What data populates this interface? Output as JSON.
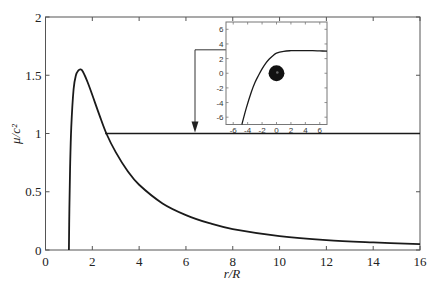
{
  "chart_data": [
    {
      "type": "line",
      "title": "",
      "xlabel": "r/R",
      "ylabel": "μ/c²",
      "xlim": [
        0,
        16
      ],
      "ylim": [
        0,
        2
      ],
      "xticks": [
        0,
        2,
        4,
        6,
        8,
        10,
        12,
        14,
        16
      ],
      "yticks": [
        0,
        0.5,
        1,
        1.5,
        2
      ],
      "ytick_labels": [
        "0",
        "0.5",
        "1",
        "1.5",
        "2"
      ],
      "grid": false,
      "series": [
        {
          "name": "mu/c^2 curve",
          "x": [
            1.0,
            1.02,
            1.05,
            1.1,
            1.2,
            1.3,
            1.4,
            1.5,
            1.6,
            1.8,
            2.0,
            2.3,
            2.6,
            3.0,
            3.5,
            4.0,
            5.0,
            6.0,
            7.0,
            8.0,
            10.0,
            12.0,
            14.0,
            16.0
          ],
          "y": [
            0.0,
            0.35,
            0.7,
            1.05,
            1.38,
            1.5,
            1.54,
            1.55,
            1.53,
            1.44,
            1.33,
            1.16,
            1.0,
            0.84,
            0.68,
            0.56,
            0.4,
            0.3,
            0.23,
            0.18,
            0.12,
            0.085,
            0.065,
            0.05
          ]
        },
        {
          "name": "horizontal reference line",
          "x": [
            2.55,
            16
          ],
          "y": [
            1,
            1
          ]
        }
      ],
      "annotations": [
        {
          "type": "arrow",
          "description": "arrow from inset left edge at inset y≈3, down to the y=1 line",
          "x_data": 6.4,
          "y_from_px": 46,
          "y_to": 1.0
        }
      ]
    },
    {
      "type": "line",
      "title": "inset",
      "xlabel": "",
      "ylabel": "",
      "xlim": [
        -7,
        7
      ],
      "ylim": [
        -7,
        7
      ],
      "xticks": [
        -6,
        -4,
        -2,
        0,
        2,
        4,
        6
      ],
      "yticks": [
        6,
        4,
        2,
        0,
        -2,
        -4,
        -6
      ],
      "grid": false,
      "series": [
        {
          "name": "inset curve",
          "x": [
            -4.8,
            -4.2,
            -3.5,
            -3.0,
            -2.5,
            -2.0,
            -1.5,
            -1.0,
            -0.5,
            0.0,
            1.0,
            2.0,
            3.0,
            4.0,
            5.0,
            6.0,
            7.0
          ],
          "y": [
            -7.0,
            -4.8,
            -2.6,
            -1.3,
            -0.3,
            0.6,
            1.35,
            1.95,
            2.4,
            2.75,
            3.0,
            3.08,
            3.1,
            3.1,
            3.08,
            3.05,
            3.02
          ]
        }
      ],
      "markers": [
        {
          "type": "filled-circle",
          "x": 0,
          "y": 0,
          "radius": 1.1,
          "color": "#111111"
        }
      ]
    }
  ],
  "main": {
    "xlabel": "r/R",
    "ylabel": "μ/c²",
    "xtick_labels": [
      "0",
      "2",
      "4",
      "6",
      "8",
      "10",
      "12",
      "14",
      "16"
    ],
    "ytick_labels": [
      "0",
      "0.5",
      "1",
      "1.5",
      "2"
    ]
  },
  "inset": {
    "xtick_labels": [
      "-6",
      "-4",
      "-2",
      "0",
      "2",
      "4",
      "6"
    ],
    "ytick_labels": [
      "6",
      "4",
      "2",
      "0",
      "-2",
      "-4",
      "-6"
    ]
  },
  "colors": {
    "curve": "#1a1a1a",
    "axis": "#555555",
    "inset_axis": "#777777",
    "marker": "#111111"
  }
}
